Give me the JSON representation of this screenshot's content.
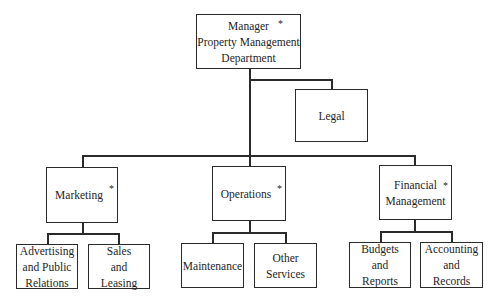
{
  "diagram": {
    "type": "org-chart",
    "root": {
      "lines": [
        "Manager",
        "Property Management",
        "Department"
      ],
      "marked": true
    },
    "staff": {
      "label": "Legal"
    },
    "departments": [
      {
        "lines": [
          "Marketing"
        ],
        "marked": true,
        "children": [
          {
            "lines": [
              "Advertising",
              "and Public",
              "Relations"
            ]
          },
          {
            "lines": [
              "Sales",
              "and",
              "Leasing"
            ]
          }
        ]
      },
      {
        "lines": [
          "Operations"
        ],
        "marked": true,
        "children": [
          {
            "lines": [
              "Maintenance"
            ]
          },
          {
            "lines": [
              "Other",
              "Services"
            ]
          }
        ]
      },
      {
        "lines": [
          "Financial",
          "Management"
        ],
        "marked": true,
        "children": [
          {
            "lines": [
              "Budgets",
              "and",
              "Reports"
            ]
          },
          {
            "lines": [
              "Accounting",
              "and",
              "Records"
            ]
          }
        ]
      }
    ],
    "marker": "*"
  }
}
